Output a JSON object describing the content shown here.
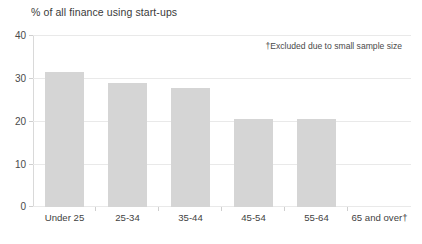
{
  "chart_data": {
    "type": "bar",
    "title": "% of all finance using start-ups",
    "xlabel": "",
    "ylabel": "",
    "categories": [
      "Under 25",
      "25-34",
      "35-44",
      "45-54",
      "55-64",
      "65 and over†"
    ],
    "values": [
      31.5,
      29.1,
      27.8,
      20.6,
      20.5,
      null
    ],
    "ylim": [
      0,
      40
    ],
    "yticks": [
      "0",
      "10",
      "20",
      "30",
      "40"
    ],
    "ytick_values": [
      0,
      10,
      20,
      30,
      40
    ],
    "grid": true,
    "legend": "none",
    "annotations": [
      {
        "name": "footnote-excluded",
        "text": "†Excluded due to small sample size",
        "position": "top-right"
      }
    ],
    "bar_color": "#d5d5d5",
    "gridline_color": "#e9e9e9",
    "axis_color": "#c9c9c9",
    "text_color": "#3f3f3f"
  },
  "chart": {
    "title": "% of all finance using start-ups",
    "footnote": "†Excluded due to small sample size",
    "bottom_clipped_text": ""
  }
}
